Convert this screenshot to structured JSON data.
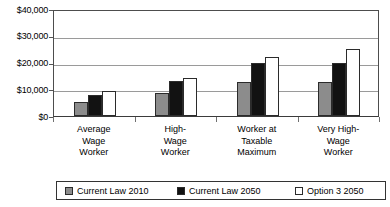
{
  "chart_data": {
    "type": "bar",
    "title": "",
    "subtitle": "",
    "xlabel": "",
    "ylabel": "",
    "ylim": [
      0,
      40000
    ],
    "grid": true,
    "legend_position": "bottom",
    "y_ticks": [
      "$0",
      "$10,000",
      "$20,000",
      "$30,000",
      "$40,000"
    ],
    "y_tick_values": [
      0,
      10000,
      20000,
      30000,
      40000
    ],
    "categories": [
      "Average\nWage\nWorker",
      "High-\nWage\nWorker",
      "Worker at\nTaxable\nMaximum",
      "Very High-\nWage\nWorker"
    ],
    "series": [
      {
        "name": "Current Law 2010",
        "color": "#8c8c8c",
        "values": [
          5200,
          8500,
          12800,
          12800
        ]
      },
      {
        "name": "Current Law 2050",
        "color": "#121212",
        "values": [
          8000,
          13000,
          20000,
          20000
        ]
      },
      {
        "name": "Option 3 2050",
        "color": "#ffffff",
        "values": [
          9500,
          14100,
          22100,
          25000
        ]
      }
    ]
  }
}
